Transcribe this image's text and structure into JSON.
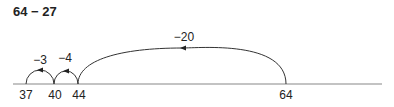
{
  "title": "64 − 27",
  "number_line": {
    "ticks": [
      {
        "value": "37",
        "x": 26
      },
      {
        "value": "40",
        "x": 54
      },
      {
        "value": "44",
        "x": 78
      },
      {
        "value": "64",
        "x": 286
      }
    ],
    "jumps": [
      {
        "label": "−3",
        "from": "40",
        "to": "37"
      },
      {
        "label": "−4",
        "from": "44",
        "to": "40"
      },
      {
        "label": "−20",
        "from": "64",
        "to": "44"
      }
    ]
  }
}
